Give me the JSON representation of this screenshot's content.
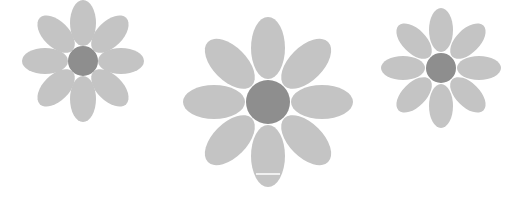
{
  "scene": {
    "background": "#ffffff",
    "description": "Three stylized gray daisies with eight oval petals around a darker round center",
    "colors": {
      "petal": "#c4c4c4",
      "center": "#8e8e8e"
    }
  },
  "flowers": [
    {
      "name": "left-flower",
      "cx": 83,
      "cy": 61,
      "center_r": 15,
      "petal_rx": 13,
      "petal_ry": 24,
      "petal_dist": 38,
      "petal_count": 8
    },
    {
      "name": "middle-flower",
      "cx": 268,
      "cy": 102,
      "center_r": 22,
      "petal_rx": 17,
      "petal_ry": 31,
      "petal_dist": 55,
      "petal_count": 8
    },
    {
      "name": "right-flower",
      "cx": 441,
      "cy": 68,
      "center_r": 15,
      "petal_rx": 12,
      "petal_ry": 23,
      "petal_dist": 38,
      "petal_count": 8
    }
  ]
}
